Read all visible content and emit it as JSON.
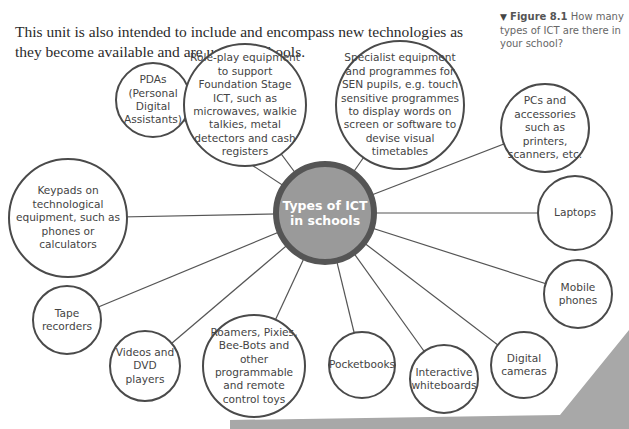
{
  "intro_text": "This unit is also intended to include and encompass new technologies as they become available and are used in schools.",
  "figure_caption": {
    "marker": "▼",
    "label": "Figure 8.1",
    "text": "How many types of ICT are there in your school?"
  },
  "diagram": {
    "center": {
      "label": "Types of ICT in schools",
      "x": 325,
      "y": 213,
      "r": 52,
      "fill": "#9a9a9a",
      "ring": "#555555"
    },
    "nodes": [
      {
        "id": "pdas",
        "label": "PDAs (Personal Digital Assistants)",
        "x": 153,
        "y": 100,
        "r": 38
      },
      {
        "id": "role-play",
        "label": "Role-play equipment to support Foundation Stage ICT, such as microwaves, walkie talkies, metal detectors and cash registers",
        "x": 245,
        "y": 105,
        "r": 62
      },
      {
        "id": "specialist",
        "label": "Specialist equipment and programmes for SEN pupils, e.g. touch sensitive programmes to display words on screen or software to devise visual timetables",
        "x": 400,
        "y": 105,
        "r": 65
      },
      {
        "id": "pcs",
        "label": "PCs and accessories such as printers, scanners, etc.",
        "x": 545,
        "y": 128,
        "r": 45
      },
      {
        "id": "keypads",
        "label": "Keypads on technological equipment, such as phones or calculators",
        "x": 68,
        "y": 218,
        "r": 60
      },
      {
        "id": "laptops",
        "label": "Laptops",
        "x": 575,
        "y": 213,
        "r": 38
      },
      {
        "id": "mobile",
        "label": "Mobile phones",
        "x": 578,
        "y": 294,
        "r": 35
      },
      {
        "id": "tape",
        "label": "Tape recorders",
        "x": 67,
        "y": 320,
        "r": 35
      },
      {
        "id": "videos",
        "label": "Videos and DVD players",
        "x": 145,
        "y": 366,
        "r": 36
      },
      {
        "id": "roamers",
        "label": "Roamers, Pixies, Bee-Bots and other programmable and remote control toys",
        "x": 254,
        "y": 366,
        "r": 52
      },
      {
        "id": "pocketbooks",
        "label": "Pocketbooks",
        "x": 362,
        "y": 365,
        "r": 34
      },
      {
        "id": "interactive",
        "label": "Interactive whiteboards",
        "x": 444,
        "y": 379,
        "r": 35
      },
      {
        "id": "digital",
        "label": "Digital cameras",
        "x": 524,
        "y": 365,
        "r": 34
      }
    ]
  },
  "colors": {
    "line": "#555555",
    "node_border": "#4a4a4a",
    "text": "#444444",
    "decoration": "#a8a8a8"
  }
}
